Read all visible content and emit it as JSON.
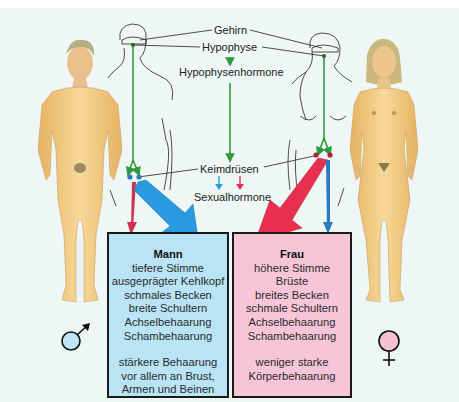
{
  "labels": {
    "brain": "Gehirn",
    "pituitary": "Hypophyse",
    "pituitary_hormones": "Hypophysenhormone",
    "gonads": "Keimdrüsen",
    "sex_hormones": "Sexualhormone"
  },
  "man": {
    "title": "Mann",
    "traits": [
      "tiefere Stimme",
      "ausgeprägter Kehlkopf",
      "schmales Becken",
      "breite Schultern",
      "Achselbehaarung",
      "Schambehaarung"
    ],
    "extra": [
      "stärkere Behaarung",
      "vor allem an Brust,",
      "Armen und Beinen"
    ],
    "symbol": "male-symbol",
    "color": "#b8e4f6"
  },
  "woman": {
    "title": "Frau",
    "traits": [
      "höhere Stimme",
      "Brüste",
      "breites Becken",
      "schmale Schultern",
      "Achselbehaarung",
      "Schambehaarung"
    ],
    "extra": [
      "weniger starke",
      "Körperbehaarung"
    ],
    "symbol": "female-symbol",
    "color": "#f6c6d8"
  },
  "colors": {
    "hormone_path": "#2e9a3a",
    "male_hormone": "#2a9ae0",
    "female_hormone": "#e8304e",
    "background": "#eef7f5",
    "skin": "#f3cf8a"
  }
}
